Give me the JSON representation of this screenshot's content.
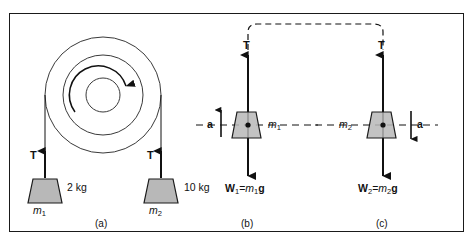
{
  "figure": {
    "type": "physics-diagram",
    "background_color": "#ffffff",
    "border_color": "#1a1a1a",
    "line_color": "#111111",
    "block_fill_color": "#b8b8b8",
    "block_stroke_color": "#1a1a1a"
  },
  "panels": [
    {
      "id": "a",
      "caption": "(a)",
      "kind": "pulley-system",
      "pulley": {
        "rotation": "clockwise",
        "circles": [
          "outer",
          "middle",
          "inner"
        ]
      },
      "left_mass": {
        "tension_label": "T",
        "weight_label": "2 kg",
        "mass_symbol": "m",
        "mass_subscript": "1"
      },
      "right_mass": {
        "tension_label": "T",
        "weight_label": "10 kg",
        "mass_symbol": "m",
        "mass_subscript": "2"
      }
    },
    {
      "id": "b",
      "caption": "(b)",
      "kind": "free-body-diagram",
      "tension_label": "T",
      "accel_label": "a",
      "accel_direction": "up",
      "accel_side": "left",
      "mass_symbol": "m",
      "mass_subscript": "1",
      "mass_label_side": "right",
      "weight": {
        "symbol": "W",
        "subscript": "1",
        "equals": "=",
        "mass_symbol": "m",
        "mass_subscript": "1",
        "g_symbol": "g"
      }
    },
    {
      "id": "c",
      "caption": "(c)",
      "kind": "free-body-diagram",
      "tension_label": "T",
      "accel_label": "a",
      "accel_direction": "down",
      "accel_side": "right",
      "mass_symbol": "m",
      "mass_subscript": "2",
      "mass_label_side": "left",
      "weight": {
        "symbol": "W",
        "subscript": "2",
        "equals": "=",
        "mass_symbol": "m",
        "mass_subscript": "2",
        "g_symbol": "g"
      }
    }
  ]
}
